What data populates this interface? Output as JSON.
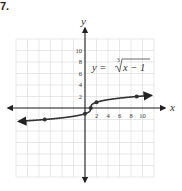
{
  "problem": {
    "number": "7."
  },
  "chart_data": {
    "type": "line",
    "title": "",
    "equation_label": "y = ∛(x − 1)",
    "equation_parts": {
      "lhs": "y = ",
      "index": "3",
      "radicand": "x − 1"
    },
    "xlabel": "x",
    "ylabel": "y",
    "xlim": [
      -12,
      12
    ],
    "ylim": [
      -12,
      12
    ],
    "grid": true,
    "x_ticks": [
      2,
      4,
      6,
      8,
      10
    ],
    "x_tick_labels": [
      "2",
      "4",
      "6",
      "8",
      "10"
    ],
    "y_ticks": [
      2,
      4,
      6,
      8,
      10
    ],
    "y_tick_labels": [
      "2",
      "4",
      "6",
      "8",
      "10"
    ],
    "series": [
      {
        "name": "y = cube root of (x - 1)",
        "function": "cbrt(x-1)",
        "domain": [
          -11.5,
          11.5
        ],
        "marked_points": [
          {
            "x": -7,
            "y": -2
          },
          {
            "x": 0,
            "y": -1
          },
          {
            "x": 1,
            "y": 0
          },
          {
            "x": 2,
            "y": 1
          },
          {
            "x": 9,
            "y": 2
          }
        ],
        "arrows": "both",
        "color": "#333333"
      }
    ],
    "colors": {
      "grid": "#d9d9d9",
      "axis": "#222222",
      "curve": "#333333",
      "text": "#333333"
    }
  }
}
